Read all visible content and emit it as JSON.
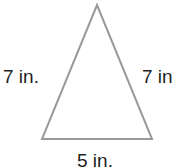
{
  "diagram": {
    "shape": "isosceles triangle",
    "stroke_color": "#9a9a9a",
    "text_color": "#1e1e1e",
    "sides": {
      "left": {
        "label": "7 in."
      },
      "right": {
        "label": "7 in"
      },
      "bottom": {
        "label": "5 in."
      }
    }
  }
}
